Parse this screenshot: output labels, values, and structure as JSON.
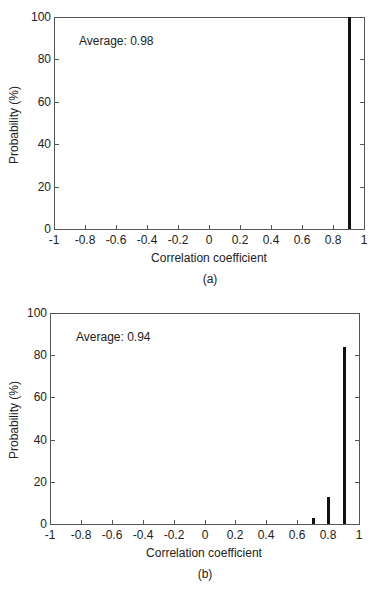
{
  "chart_data": [
    {
      "type": "bar",
      "caption": "(a)",
      "annotation": "Average: 0.98",
      "xlabel": "Correlation coefficient",
      "ylabel": "Probability (%)",
      "xlim": [
        -1,
        1
      ],
      "ylim": [
        0,
        100
      ],
      "xticks": [
        "-1",
        "-0.8",
        "-0.6",
        "-0.4",
        "-0.2",
        "0",
        "0.2",
        "0.4",
        "0.6",
        "0.8",
        "1"
      ],
      "yticks": [
        "0",
        "20",
        "40",
        "60",
        "80",
        "100"
      ],
      "grid": false,
      "x": [
        0.9
      ],
      "values": [
        100
      ]
    },
    {
      "type": "bar",
      "caption": "(b)",
      "annotation": "Average: 0.94",
      "xlabel": "Correlation coefficient",
      "ylabel": "Probability (%)",
      "xlim": [
        -1,
        1
      ],
      "ylim": [
        0,
        100
      ],
      "xticks": [
        "-1",
        "-0.8",
        "-0.6",
        "-0.4",
        "-0.2",
        "0",
        "0.2",
        "0.4",
        "0.6",
        "0.8",
        "1"
      ],
      "yticks": [
        "0",
        "20",
        "40",
        "60",
        "80",
        "100"
      ],
      "grid": false,
      "x": [
        0.7,
        0.8,
        0.9
      ],
      "values": [
        3,
        13,
        84
      ]
    }
  ],
  "colors": {
    "bar": "#111111",
    "axis": "#555555",
    "text": "#222222"
  }
}
